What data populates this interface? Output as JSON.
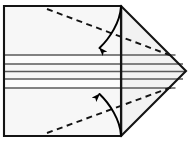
{
  "figure": {
    "title": "Origami fold step diagram",
    "type": "paper-folding-instruction",
    "canvas": {
      "width": 188,
      "height": 143
    },
    "colors": {
      "background": "#ffffff",
      "outline": "#1a1a1a",
      "crease_line": "#555555",
      "fill_body": "#f7f7f7",
      "fill_band": "#fbfbfb",
      "fill_point": "#f2f2f2",
      "dashed_fold": "#111111",
      "arrow": "#000000"
    },
    "geometry": {
      "rect_left": 4,
      "rect_right": 121,
      "rect_top": 6,
      "rect_bottom": 136,
      "tip_x": 186,
      "tip_y": 71,
      "band_line_1_y": 55,
      "band_line_2_y": 64,
      "band_line_3_y": 79,
      "band_line_4_y": 88,
      "center_y": 71
    },
    "elements": {
      "body_rectangle_label": "Main paper body",
      "right_point_label": "Folded triangular point",
      "upper_band_label": "Upper crease band",
      "lower_band_label": "Lower crease band",
      "center_crease_label": "Center horizontal crease",
      "vertical_crease_label": "Vertical crease at point base",
      "upper_dashed_label": "Upper diagonal fold line",
      "lower_dashed_label": "Lower diagonal fold line",
      "upper_arrow_label": "Fold down arrow",
      "lower_arrow_label": "Fold up arrow"
    },
    "annotations": []
  }
}
